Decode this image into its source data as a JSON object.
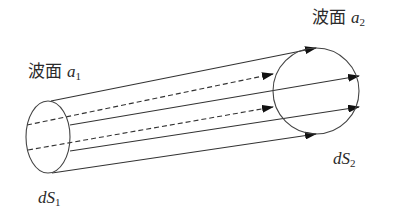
{
  "labels": {
    "wavefront_1": {
      "text": "波面",
      "var": "a",
      "sub": "1"
    },
    "wavefront_2": {
      "text": "波面",
      "var": "a",
      "sub": "2"
    },
    "area_1": {
      "var": "dS",
      "sub": "1"
    },
    "area_2": {
      "var": "dS",
      "sub": "2"
    }
  },
  "colors": {
    "stroke": "#333333",
    "arrow": "#111111",
    "background": "#ffffff"
  },
  "geometry": {
    "ellipse_1": {
      "cx": 48,
      "cy": 137,
      "rx": 22,
      "ry": 36
    },
    "circle_2": {
      "cx": 316,
      "cy": 91,
      "r": 43
    },
    "rays": [
      {
        "style": "solid",
        "from": [
          51,
          101
        ],
        "to": [
          316,
          48
        ]
      },
      {
        "style": "dashed",
        "from": [
          27,
          125
        ],
        "to": [
          273,
          74
        ]
      },
      {
        "style": "solid",
        "from": [
          70,
          125
        ],
        "to": [
          359,
          76
        ]
      },
      {
        "style": "dashed",
        "from": [
          28,
          150
        ],
        "to": [
          273,
          107
        ]
      },
      {
        "style": "solid",
        "from": [
          70,
          151
        ],
        "to": [
          359,
          107
        ]
      },
      {
        "style": "solid",
        "from": [
          52,
          173
        ],
        "to": [
          316,
          134
        ]
      }
    ]
  }
}
